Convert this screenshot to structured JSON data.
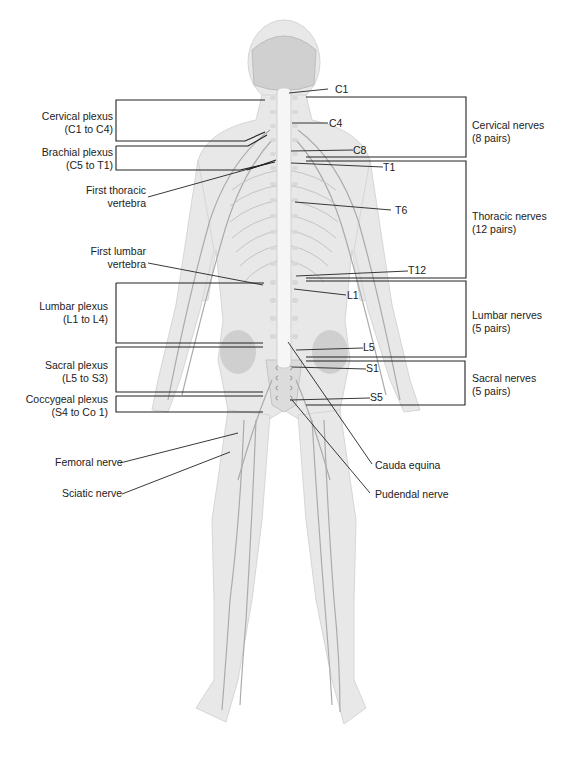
{
  "figure": {
    "colors": {
      "body": "#e6e6e6",
      "body_edge": "#d4d4d4",
      "nerve": "#a8a8a8",
      "spine": "#f4f4f4",
      "line": "#222222"
    }
  },
  "left_labels": {
    "cervical_plexus": {
      "line1": "Cervical plexus",
      "line2": "(C1 to C4)"
    },
    "brachial_plexus": {
      "line1": "Brachial plexus",
      "line2": "(C5 to T1)"
    },
    "first_thoracic": {
      "line1": "First thoracic",
      "line2": "vertebra"
    },
    "first_lumbar": {
      "line1": "First lumbar",
      "line2": "vertebra"
    },
    "lumbar_plexus": {
      "line1": "Lumbar plexus",
      "line2": "(L1 to L4)"
    },
    "sacral_plexus": {
      "line1": "Sacral plexus",
      "line2": "(L5 to S3)"
    },
    "coccygeal_plexus": {
      "line1": "Coccygeal plexus",
      "line2": "(S4 to Co 1)"
    },
    "femoral_nerve": "Femoral nerve",
    "sciatic_nerve": "Sciatic nerve"
  },
  "vertebra_labels": [
    "C1",
    "C4",
    "C8",
    "T1",
    "T6",
    "T12",
    "L1",
    "L5",
    "S1",
    "S5"
  ],
  "right_labels": {
    "cervical_nerves": {
      "line1": "Cervical nerves",
      "line2": "(8 pairs)"
    },
    "thoracic_nerves": {
      "line1": "Thoracic nerves",
      "line2": "(12 pairs)"
    },
    "lumbar_nerves": {
      "line1": "Lumbar nerves",
      "line2": "(5 pairs)"
    },
    "sacral_nerves": {
      "line1": "Sacral nerves",
      "line2": "(5 pairs)"
    },
    "cauda_equina": "Cauda equina",
    "pudendal_nerve": "Pudendal nerve"
  }
}
